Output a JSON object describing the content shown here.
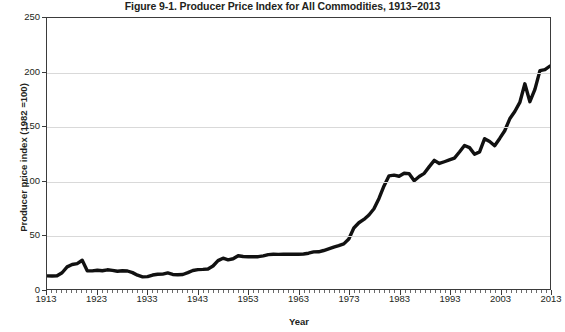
{
  "chart_data": {
    "type": "line",
    "title": "Figure 9-1. Producer Price Index for All Commodities, 1913–2013",
    "xlabel": "Year",
    "ylabel": "Producer price index (1982 =100)",
    "xlim": [
      1913,
      2013
    ],
    "ylim": [
      0,
      250
    ],
    "grid": true,
    "legend": "none",
    "y_ticks": [
      0,
      50,
      100,
      150,
      200,
      250
    ],
    "y_tick_labels": [
      "0",
      "50",
      "100",
      "150",
      "200",
      "250"
    ],
    "x_ticks": [
      1913,
      1923,
      1933,
      1943,
      1953,
      1963,
      1973,
      1983,
      1993,
      2003,
      2013
    ],
    "x_tick_labels": [
      "1913",
      "1923",
      "1933",
      "1943",
      "1953",
      "1963",
      "1973",
      "1983",
      "1993",
      "2003",
      "2013"
    ],
    "x_minor_tick_step": 1,
    "series": [
      {
        "name": "Producer Price Index, All Commodities",
        "color": "#111111",
        "line_width": 3.4,
        "x": [
          1913,
          1914,
          1915,
          1916,
          1917,
          1918,
          1919,
          1920,
          1921,
          1922,
          1923,
          1924,
          1925,
          1926,
          1927,
          1928,
          1929,
          1930,
          1931,
          1932,
          1933,
          1934,
          1935,
          1936,
          1937,
          1938,
          1939,
          1940,
          1941,
          1942,
          1943,
          1944,
          1945,
          1946,
          1947,
          1948,
          1949,
          1950,
          1951,
          1952,
          1953,
          1954,
          1955,
          1956,
          1957,
          1958,
          1959,
          1960,
          1961,
          1962,
          1963,
          1964,
          1965,
          1966,
          1967,
          1968,
          1969,
          1970,
          1971,
          1972,
          1973,
          1974,
          1975,
          1976,
          1977,
          1978,
          1979,
          1980,
          1981,
          1982,
          1983,
          1984,
          1985,
          1986,
          1987,
          1988,
          1989,
          1990,
          1991,
          1992,
          1993,
          1994,
          1995,
          1996,
          1997,
          1998,
          1999,
          2000,
          2001,
          2002,
          2003,
          2004,
          2005,
          2006,
          2007,
          2008,
          2009,
          2010,
          2011,
          2012,
          2013
        ],
        "y": [
          12.1,
          12.0,
          12.2,
          15.0,
          20.4,
          22.6,
          23.4,
          26.5,
          16.8,
          16.7,
          17.3,
          16.8,
          17.7,
          17.2,
          16.4,
          16.8,
          16.6,
          15.1,
          12.7,
          11.2,
          11.4,
          12.9,
          13.6,
          13.7,
          14.8,
          13.4,
          13.1,
          13.4,
          15.1,
          17.1,
          17.9,
          18.1,
          18.5,
          21.2,
          26.2,
          28.4,
          26.9,
          27.9,
          30.7,
          30.0,
          29.7,
          29.8,
          29.8,
          30.6,
          31.7,
          32.0,
          31.9,
          32.0,
          32.0,
          32.2,
          32.1,
          32.3,
          33.0,
          34.2,
          34.3,
          35.5,
          37.0,
          38.6,
          40.0,
          41.6,
          46.1,
          56.3,
          61.1,
          64.2,
          68.3,
          74.0,
          83.5,
          95.1,
          104.4,
          105.0,
          104.0,
          106.8,
          106.4,
          99.9,
          103.8,
          106.7,
          112.9,
          118.7,
          115.8,
          117.4,
          119.1,
          120.8,
          126.4,
          132.4,
          130.4,
          124.3,
          126.5,
          138.7,
          136.1,
          132.2,
          138.9,
          146.0,
          157.0,
          163.7,
          172.1,
          189.3,
          172.8,
          184.2,
          201.5,
          202.4,
          205.7
        ]
      }
    ]
  }
}
